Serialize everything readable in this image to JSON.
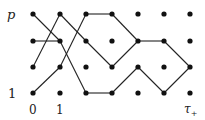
{
  "labels": {
    "row_top": "p",
    "row_bottom": "1",
    "col_first": "0",
    "col_second": "1",
    "col_last_main": "τ",
    "col_last_sub": "+"
  },
  "grid": {
    "columns_x": [
      33,
      60,
      86,
      112,
      138,
      164,
      190
    ],
    "rows_y": [
      14,
      41,
      67,
      93
    ]
  },
  "edges": [
    [
      [
        0,
        0
      ],
      [
        1,
        1
      ]
    ],
    [
      [
        1,
        1
      ],
      [
        2,
        3
      ]
    ],
    [
      [
        2,
        3
      ],
      [
        3,
        3
      ]
    ],
    [
      [
        3,
        3
      ],
      [
        4,
        2
      ]
    ],
    [
      [
        4,
        2
      ],
      [
        5,
        3
      ]
    ],
    [
      [
        5,
        3
      ],
      [
        6,
        2
      ]
    ],
    [
      [
        0,
        1
      ],
      [
        1,
        1
      ]
    ],
    [
      [
        0,
        2
      ],
      [
        1,
        0
      ]
    ],
    [
      [
        1,
        0
      ],
      [
        2,
        1
      ]
    ],
    [
      [
        2,
        1
      ],
      [
        3,
        2
      ]
    ],
    [
      [
        3,
        2
      ],
      [
        4,
        1
      ]
    ],
    [
      [
        4,
        1
      ],
      [
        5,
        1
      ]
    ],
    [
      [
        5,
        1
      ],
      [
        6,
        2
      ]
    ],
    [
      [
        0,
        3
      ],
      [
        1,
        2
      ]
    ],
    [
      [
        1,
        2
      ],
      [
        2,
        0
      ]
    ],
    [
      [
        2,
        0
      ],
      [
        3,
        0
      ]
    ],
    [
      [
        3,
        0
      ],
      [
        4,
        1
      ]
    ]
  ],
  "colors": {
    "ink": "#222222",
    "background": "#ffffff"
  }
}
